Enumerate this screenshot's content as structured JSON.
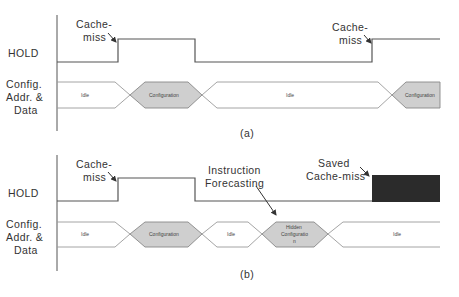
{
  "diagram": {
    "type": "timing-diagram",
    "colors": {
      "line": "#555555",
      "bus_line": "#9a9a9a",
      "config_fill": "#cfcfcf",
      "saved_block": "#2b2b2b",
      "text": "#333333"
    },
    "panels": [
      {
        "caption": "(a)",
        "signals": {
          "hold": "HOLD",
          "bus_line1": "Config.",
          "bus_line2": "Addr. &",
          "bus_line3": "Data"
        },
        "annotations": [
          {
            "line1": "Cache-",
            "line2": "miss"
          },
          {
            "line1": "Cache-",
            "line2": "miss"
          }
        ],
        "bus_segments": [
          {
            "label": "Idle",
            "kind": "idle"
          },
          {
            "label": "Configuration",
            "kind": "config"
          },
          {
            "label": "Idle",
            "kind": "idle"
          },
          {
            "label": "Configuration",
            "kind": "config"
          }
        ]
      },
      {
        "caption": "(b)",
        "signals": {
          "hold": "HOLD",
          "bus_line1": "Config.",
          "bus_line2": "Addr. &",
          "bus_line3": "Data"
        },
        "annotations": [
          {
            "line1": "Cache-",
            "line2": "miss"
          },
          {
            "line1": "Instruction",
            "line2": "Forecasting"
          },
          {
            "line1": "Saved",
            "line2": "Cache-miss"
          }
        ],
        "bus_segments": [
          {
            "label": "Idle",
            "kind": "idle"
          },
          {
            "label": "Configuration",
            "kind": "config"
          },
          {
            "label": "Idle",
            "kind": "idle"
          },
          {
            "label_line1": "Hidden",
            "label_line2": "Configuratio",
            "label_line3": "n",
            "kind": "hidden-config"
          },
          {
            "label": "Idle",
            "kind": "idle"
          }
        ]
      }
    ]
  }
}
